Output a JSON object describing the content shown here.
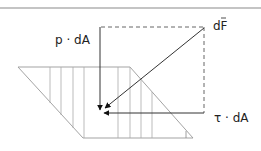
{
  "diagram": {
    "labels": {
      "pressure_force": "p · dA",
      "total_force": "dF",
      "shear_force": "τ · dA"
    },
    "colors": {
      "line": "#333333",
      "hatch": "#999999",
      "rule": "#8a8a8a",
      "dashed": "#555555"
    }
  }
}
